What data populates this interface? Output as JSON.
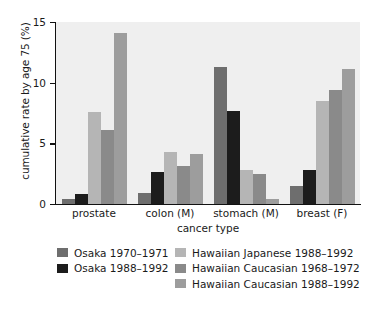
{
  "chart_data": {
    "type": "bar",
    "title": "",
    "xlabel": "cancer type",
    "ylabel": "cumulative rate by age 75 (%)",
    "categories": [
      "prostate",
      "colon (M)",
      "stomach (M)",
      "breast (F)"
    ],
    "ylim": [
      0,
      15
    ],
    "yticks": [
      0,
      5,
      10,
      15
    ],
    "ytick_labels": [
      "0",
      "5",
      "10",
      "15"
    ],
    "grid": false,
    "legend_position": "below",
    "series": [
      {
        "name": "Osaka 1970–1971",
        "color": "#6e6e6e",
        "values": [
          0.4,
          0.9,
          11.3,
          1.5
        ]
      },
      {
        "name": "Osaka 1988–1992",
        "color": "#1c1c1c",
        "values": [
          0.8,
          2.6,
          7.7,
          2.8
        ]
      },
      {
        "name": "Hawaiian Japanese 1988–1992",
        "color": "#b5b5b5",
        "values": [
          7.6,
          4.3,
          2.8,
          8.5
        ]
      },
      {
        "name": "Hawaiian Caucasian 1968–1972",
        "color": "#8a8a8a",
        "values": [
          6.1,
          3.1,
          2.5,
          9.4
        ]
      },
      {
        "name": "Hawaiian Caucasian 1988–1992",
        "color": "#9d9d9d",
        "values": [
          14.1,
          4.1,
          0.4,
          11.1
        ]
      }
    ]
  },
  "legend": {
    "left_column": [
      {
        "label": "Osaka 1970–1971",
        "color": "#6e6e6e"
      },
      {
        "label": "Osaka 1988–1992",
        "color": "#1c1c1c"
      }
    ],
    "right_column": [
      {
        "label": "Hawaiian Japanese 1988–1992",
        "color": "#b5b5b5"
      },
      {
        "label": "Hawaiian Caucasian 1968–1972",
        "color": "#8a8a8a"
      },
      {
        "label": "Hawaiian Caucasian 1988–1992",
        "color": "#9d9d9d"
      }
    ]
  }
}
